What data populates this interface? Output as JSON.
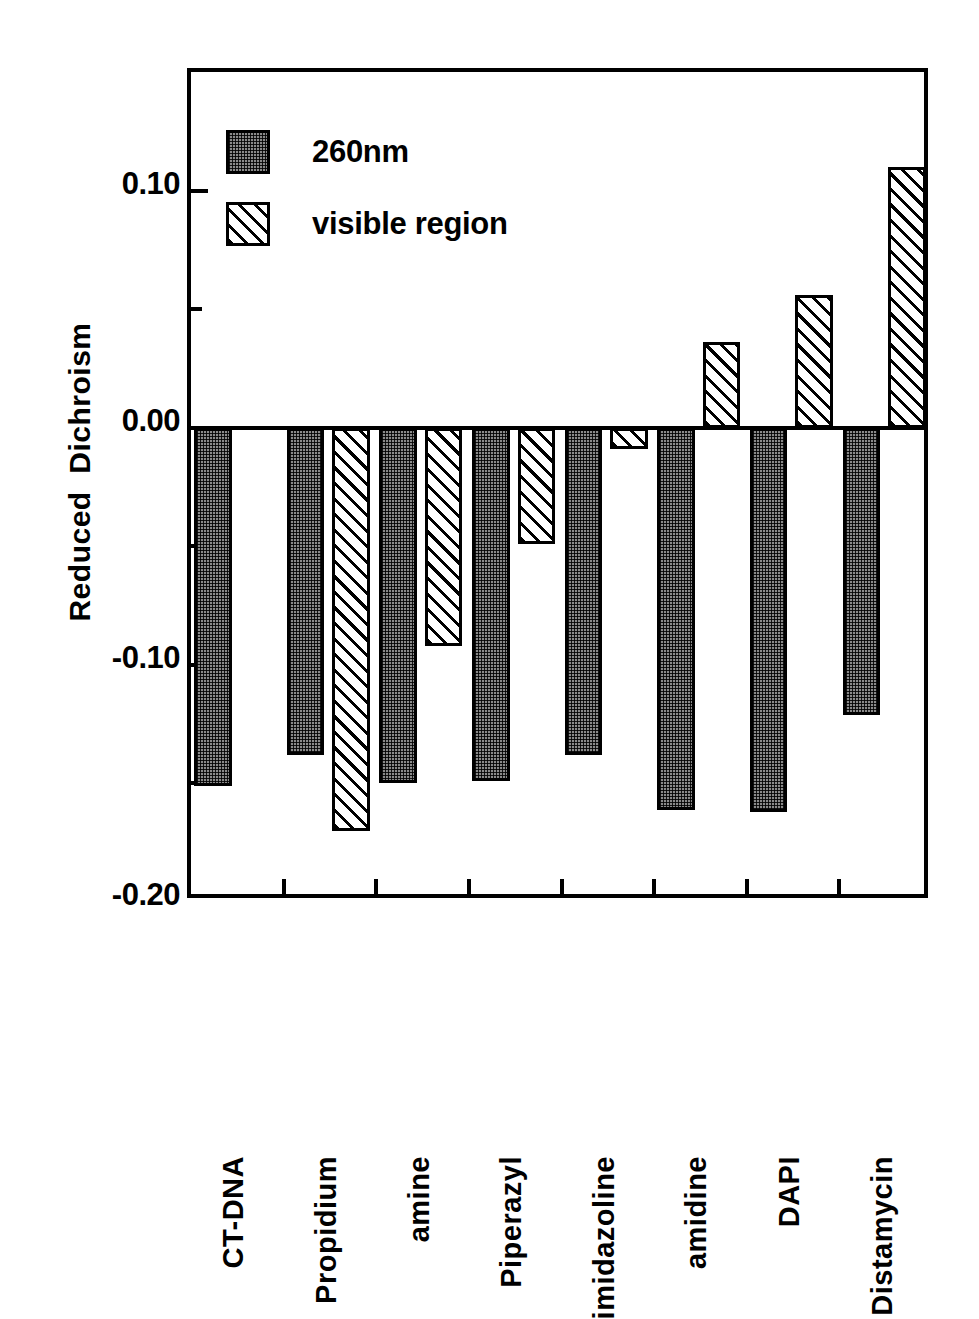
{
  "chart_data": {
    "type": "bar",
    "title": "",
    "xlabel": "",
    "ylabel": "Reduced  Dichroism",
    "ylim": [
      -0.2,
      0.15
    ],
    "ytick_values": [
      0.1,
      0.0,
      -0.1,
      -0.2
    ],
    "ytick_labels": [
      "0.10",
      "0.00",
      "-0.10",
      "-0.20"
    ],
    "yminor_values": [
      0.05,
      -0.05,
      -0.15
    ],
    "grid": false,
    "legend_position": "top-left",
    "categories": [
      "CT-DNA",
      "Propidium",
      "amine",
      "Piperazyl",
      "imidazoline",
      "amidine",
      "DAPI",
      "Distamycin"
    ],
    "series": [
      {
        "name": "260nm",
        "pattern": "checkered-dot",
        "values": [
          -0.151,
          -0.138,
          -0.15,
          -0.149,
          -0.138,
          -0.161,
          -0.162,
          -0.121
        ]
      },
      {
        "name": "visible region",
        "pattern": "diagonal-hatch",
        "values": [
          null,
          -0.17,
          -0.092,
          -0.049,
          -0.009,
          0.036,
          0.056,
          0.11
        ]
      }
    ],
    "legend": [
      {
        "label": "260nm",
        "pattern": "checkered-dot"
      },
      {
        "label": "visible region",
        "pattern": "diagonal-hatch"
      }
    ],
    "colors": {
      "axis": "#000000",
      "background": "#ffffff",
      "series_260nm_fill": "#8a8a8a",
      "series_visible_fill": "#ffffff"
    }
  }
}
